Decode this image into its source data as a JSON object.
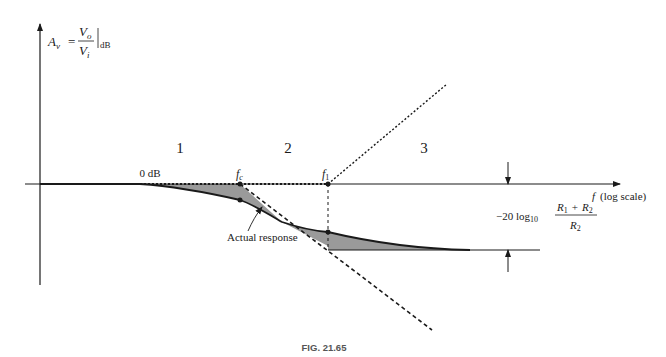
{
  "figure": {
    "caption": "FIG. 21.65",
    "y_axis": {
      "symbol": "A",
      "subscript": "v",
      "equals": "=",
      "numerator": "V",
      "numerator_sub": "o",
      "denominator": "V",
      "denominator_sub": "i",
      "unit": "dB"
    },
    "x_axis": {
      "symbol": "f",
      "label": "(log scale)"
    },
    "zero_label": "0 dB",
    "regions": [
      "1",
      "2",
      "3"
    ],
    "points": {
      "fc": {
        "symbol": "f",
        "sub": "c"
      },
      "f1": {
        "symbol": "f",
        "sub": "1"
      }
    },
    "curve_label": "Actual response",
    "attenuation": {
      "prefix": "−20 log",
      "prefix_sub": "10",
      "numerator": "R",
      "num_sub1": "1",
      "plus": "+",
      "num_r2": "R",
      "num_sub2": "2",
      "denominator": "R",
      "den_sub": "2"
    },
    "colors": {
      "line": "#1a1a1a",
      "shade": "#9a9a9a",
      "background": "#ffffff"
    }
  }
}
